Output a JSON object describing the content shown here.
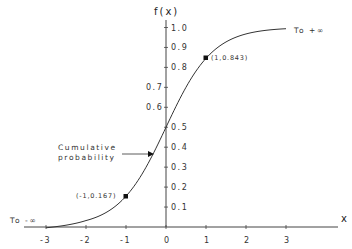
{
  "chart_data": {
    "type": "line",
    "title": "",
    "xlabel": "x",
    "ylabel": "f(x)",
    "xlim": [
      -3.5,
      4.3
    ],
    "ylim": [
      0,
      1.0
    ],
    "grid": false,
    "legend": null,
    "x_ticks": [
      "-3",
      "-2",
      "-1",
      "0",
      "1",
      "2",
      "3"
    ],
    "y_ticks": [
      "0.1",
      "0.2",
      "0.3",
      "0.4",
      "0.5",
      "0.6",
      "0.7",
      "0.8",
      "0.9",
      "1.0"
    ],
    "series": [
      {
        "name": "Cumulative probability",
        "function": "logistic CDF f(x) = 1/(1+e^(-1.7x))",
        "x": [
          -3,
          -2.5,
          -2,
          -1.5,
          -1,
          -0.5,
          0,
          0.5,
          1,
          1.5,
          2,
          2.5,
          3
        ],
        "values": [
          0.006,
          0.014,
          0.032,
          0.072,
          0.167,
          0.3,
          0.5,
          0.7,
          0.843,
          0.928,
          0.968,
          0.986,
          0.994
        ]
      }
    ],
    "marked_points": [
      {
        "x": -1,
        "y": 0.167,
        "label": "(-1,0.167)"
      },
      {
        "x": 1,
        "y": 0.843,
        "label": "(1,0.843)"
      }
    ],
    "annotations": {
      "upper_tail": "To +∞",
      "lower_tail": "To -∞",
      "curve_label_line1": "Cumulative",
      "curve_label_line2": "probability"
    }
  }
}
